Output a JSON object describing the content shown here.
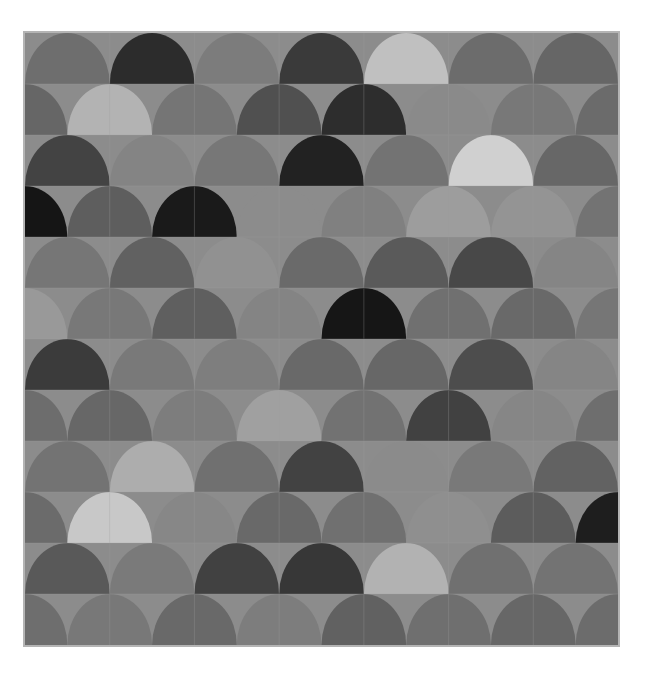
{
  "figure": {
    "width": 654,
    "height": 681,
    "background": "#ffffff",
    "axes_background": "#8c8c8c",
    "spine_color": "#b4b4b4",
    "spine_width": 2,
    "grid_color": "#9c9c9c",
    "grid_width": 1,
    "grid_visible": true
  },
  "axes": {
    "left": 25,
    "top": 33,
    "width": 593,
    "height": 612
  },
  "chart_data": {
    "type": "heatmap",
    "title": "",
    "subtitle": "",
    "xlabel": "",
    "ylabel": "",
    "legend": [],
    "annotations": [],
    "grid": true,
    "legend_position": "none",
    "pattern": "fish-scale semicircle scallop tiling, alternating rows offset by half a tile",
    "tile": {
      "width": 84.71,
      "height": 51.0,
      "shape": "semicircle-dome",
      "orientation": "dome-up"
    },
    "ncols": 7,
    "nrows": 12,
    "xlim": [
      0,
      7
    ],
    "ylim": [
      0,
      12
    ],
    "xticks": [
      0,
      1,
      2,
      3,
      4,
      5,
      6,
      7
    ],
    "yticks": [
      0,
      1,
      2,
      3,
      4,
      5,
      6,
      7,
      8,
      9,
      10,
      11,
      12
    ],
    "xticklabels": [],
    "yticklabels": [],
    "colormap": "gray",
    "value_range": [
      0,
      1
    ],
    "values": [
      [
        0.44,
        0.13,
        0.5,
        0.22,
        0.78,
        0.43,
        0.4
      ],
      [
        0.4,
        0.72,
        0.46,
        0.31,
        0.14,
        0.55,
        0.47,
        0.42
      ],
      [
        0.26,
        0.52,
        0.47,
        0.13,
        0.45,
        0.84,
        0.4
      ],
      [
        0.07,
        0.37,
        0.09,
        0.55,
        0.5,
        0.62,
        0.58,
        0.45
      ],
      [
        0.46,
        0.38,
        0.57,
        0.42,
        0.35,
        0.28,
        0.52
      ],
      [
        0.6,
        0.47,
        0.37,
        0.52,
        0.08,
        0.44,
        0.41,
        0.46
      ],
      [
        0.23,
        0.47,
        0.5,
        0.41,
        0.4,
        0.3,
        0.52
      ],
      [
        0.43,
        0.4,
        0.5,
        0.63,
        0.45,
        0.25,
        0.52,
        0.43
      ],
      [
        0.45,
        0.68,
        0.44,
        0.26,
        0.55,
        0.47,
        0.38
      ],
      [
        0.42,
        0.8,
        0.53,
        0.41,
        0.44,
        0.56,
        0.36,
        0.11
      ],
      [
        0.35,
        0.48,
        0.25,
        0.21,
        0.7,
        0.44,
        0.45
      ],
      [
        0.44,
        0.47,
        0.41,
        0.49,
        0.38,
        0.44,
        0.4,
        0.42
      ]
    ],
    "row_colors": [
      [
        "#6e6e6e",
        "#2c2c2c",
        "#7c7c7c",
        "#3a3a3a",
        "#c0c0c0",
        "#6c6c6c",
        "#666666"
      ],
      [
        "#666666",
        "#b3b3b3",
        "#757575",
        "#505050",
        "#2d2d2d",
        "#8a8a8a",
        "#787878",
        "#6b6b6b"
      ],
      [
        "#434343",
        "#848484",
        "#777777",
        "#222222",
        "#737373",
        "#d0d0d0",
        "#676767"
      ],
      [
        "#151515",
        "#5e5e5e",
        "#1a1a1a",
        "#8c8c8c",
        "#808080",
        "#9d9d9d",
        "#949494",
        "#737373"
      ],
      [
        "#767676",
        "#616161",
        "#919191",
        "#6a6a6a",
        "#5a5a5a",
        "#484848",
        "#858585"
      ],
      [
        "#999999",
        "#787878",
        "#5f5f5f",
        "#848484",
        "#161616",
        "#707070",
        "#696969",
        "#767676"
      ],
      [
        "#3b3b3b",
        "#797979",
        "#7e7e7e",
        "#696969",
        "#676767",
        "#4d4d4d",
        "#858585"
      ],
      [
        "#6d6d6d",
        "#676767",
        "#7d7d7d",
        "#a0a0a0",
        "#727272",
        "#414141",
        "#868686",
        "#6e6e6e"
      ],
      [
        "#737373",
        "#adadad",
        "#707070",
        "#424242",
        "#8b8b8b",
        "#797979",
        "#626262"
      ],
      [
        "#6b6b6b",
        "#c8c8c8",
        "#878787",
        "#696969",
        "#707070",
        "#8f8f8f",
        "#5c5c5c",
        "#1e1e1e"
      ],
      [
        "#595959",
        "#7a7a7a",
        "#414141",
        "#373737",
        "#b2b2b2",
        "#707070",
        "#737373"
      ],
      [
        "#6e6e6e",
        "#787878",
        "#696969",
        "#7d7d7d",
        "#616161",
        "#6f6f6f",
        "#676767",
        "#6c6c6c"
      ]
    ]
  }
}
